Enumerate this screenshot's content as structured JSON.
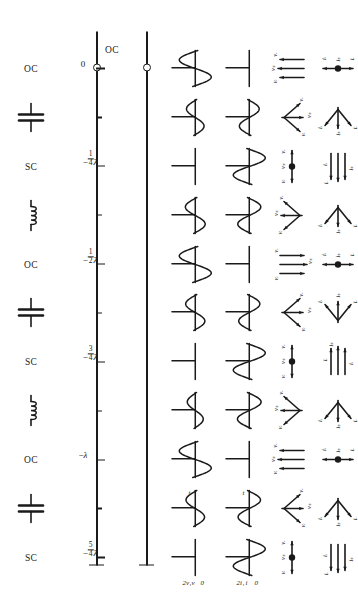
{
  "figure": {
    "orientation": "rotated-90-ccw"
  },
  "distance_axis": {
    "name": "distance-axis",
    "unit": "lambda",
    "ticks": [
      {
        "value": 0,
        "label": "0"
      },
      {
        "value": -0.125,
        "label": ""
      },
      {
        "value": -0.25,
        "label": "-1/4 λ",
        "num": "1",
        "den": "4",
        "sign": "−",
        "lam": "λ"
      },
      {
        "value": -0.375,
        "label": ""
      },
      {
        "value": -0.5,
        "label": "-1/2 λ",
        "num": "1",
        "den": "2",
        "sign": "−",
        "lam": "λ"
      },
      {
        "value": -0.625,
        "label": ""
      },
      {
        "value": -0.75,
        "label": "-3/4 λ",
        "num": "3",
        "den": "4",
        "sign": "−",
        "lam": "λ"
      },
      {
        "value": -0.875,
        "label": ""
      },
      {
        "value": -1.0,
        "label": "-λ",
        "num": "",
        "den": "",
        "sign": "−",
        "lam": "λ"
      },
      {
        "value": -1.125,
        "label": ""
      },
      {
        "value": -1.25,
        "label": "-5/4 λ",
        "num": "5",
        "den": "4",
        "sign": "−",
        "lam": "λ"
      }
    ]
  },
  "columns": [
    {
      "key": "line",
      "label": "transmission-line"
    },
    {
      "key": "voltage",
      "label": "voltage standing wave",
      "axis_labels": [
        "2v₁",
        "v",
        "0",
        "t"
      ],
      "peak_label": "2v₁",
      "var_label": "v",
      "zero_label": "0",
      "time_label": "t"
    },
    {
      "key": "current",
      "label": "current standing wave",
      "axis_labels": [
        "2i₁",
        "i",
        "0",
        "t"
      ],
      "peak_label": "2i₁",
      "var_label": "i",
      "zero_label": "0",
      "time_label": "t"
    },
    {
      "key": "vphasor",
      "label": "voltage phasor diagram",
      "components": [
        "v₁",
        "v",
        "v_r"
      ]
    },
    {
      "key": "iphasor",
      "label": "current phasor diagram",
      "components": [
        "i₁",
        "i",
        "i_r"
      ]
    },
    {
      "key": "circuit",
      "label": "equivalent circuit"
    }
  ],
  "phasor_labels": {
    "v_incident": "v",
    "v_incident_sub": "i",
    "v_sum": "v",
    "v_sum_sub": "s",
    "v_reflected": "v",
    "v_reflected_sub": "r",
    "i_incident": "i",
    "i_incident_sub": "i",
    "i_sum": "i",
    "i_sum_sub": "s",
    "i_reflected": "i",
    "i_reflected_sub": "r"
  },
  "rows": [
    {
      "z": 0.0,
      "circuit": "OC",
      "circuit_label": "OC",
      "v_wave": "large-s",
      "i_wave": "flat",
      "v_phasor": "parallel-up",
      "i_phasor": "opposed-vertical"
    },
    {
      "z": -0.125,
      "circuit": "capacitor",
      "circuit_label": "",
      "v_wave": "medium-s",
      "i_wave": "medium-s-inv",
      "v_phasor": "fan-down",
      "i_phasor": "fan-right"
    },
    {
      "z": -0.25,
      "circuit": "SC",
      "circuit_label": "SC",
      "v_wave": "flat",
      "i_wave": "large-s-inv",
      "v_phasor": "opposed-horizontal",
      "i_phasor": "parallel-left"
    },
    {
      "z": -0.375,
      "circuit": "inductor",
      "circuit_label": "",
      "v_wave": "medium-s2",
      "i_wave": "medium-s-inv2",
      "v_phasor": "fan-up",
      "i_phasor": "fan-right2"
    },
    {
      "z": -0.5,
      "circuit": "OC",
      "circuit_label": "OC",
      "v_wave": "large-s",
      "i_wave": "flat",
      "v_phasor": "parallel-down",
      "i_phasor": "opposed-vertical"
    },
    {
      "z": -0.625,
      "circuit": "capacitor",
      "circuit_label": "",
      "v_wave": "medium-s3",
      "i_wave": "medium-s-inv3",
      "v_phasor": "fan-down2",
      "i_phasor": "fan-left"
    },
    {
      "z": -0.75,
      "circuit": "SC",
      "circuit_label": "SC",
      "v_wave": "flat",
      "i_wave": "large-s-inv",
      "v_phasor": "opposed-horizontal2",
      "i_phasor": "parallel-right"
    },
    {
      "z": -0.875,
      "circuit": "inductor",
      "circuit_label": "",
      "v_wave": "medium-s4",
      "i_wave": "medium-s-inv4",
      "v_phasor": "fan-up2",
      "i_phasor": "fan-right3"
    },
    {
      "z": -1.0,
      "circuit": "OC",
      "circuit_label": "OC",
      "v_wave": "large-s",
      "i_wave": "flat",
      "v_phasor": "parallel-up2",
      "i_phasor": "opposed-vertical"
    },
    {
      "z": -1.125,
      "circuit": "capacitor",
      "circuit_label": "",
      "v_wave": "medium-s5",
      "i_wave": "medium-s-inv5",
      "v_phasor": "fan-down3",
      "i_phasor": "fan-right4"
    },
    {
      "z": -1.25,
      "circuit": "SC",
      "circuit_label": "SC",
      "v_wave": "flat",
      "i_wave": "large-s-inv",
      "v_phasor": "opposed-horizontal3",
      "i_phasor": "parallel-left2"
    }
  ],
  "circuit_symbols": {
    "OC": "open-circuit-text",
    "SC": "short-circuit-text",
    "capacitor": "capacitor-symbol",
    "inductor": "inductor-coil-symbol"
  },
  "colors": {
    "ink": "#1a1a1a",
    "background": "#ffffff"
  }
}
